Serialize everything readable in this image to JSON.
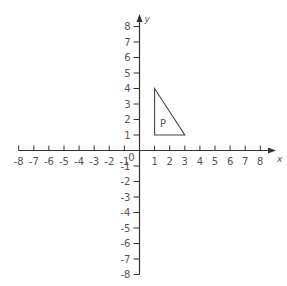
{
  "diagram": {
    "type": "coordinate-grid",
    "x_axis": {
      "label": "x",
      "min": -8,
      "max": 8,
      "ticks": [
        -8,
        -7,
        -6,
        -5,
        -4,
        -3,
        -2,
        -1,
        1,
        2,
        3,
        4,
        5,
        6,
        7,
        8
      ]
    },
    "y_axis": {
      "label": "y",
      "min": -8,
      "max": 8,
      "ticks": [
        -8,
        -7,
        -6,
        -5,
        -4,
        -3,
        -2,
        -1,
        1,
        2,
        3,
        4,
        5,
        6,
        7,
        8
      ]
    },
    "origin_label": "0",
    "shapes": [
      {
        "name": "P",
        "type": "triangle",
        "vertices": [
          [
            1,
            4
          ],
          [
            1,
            1
          ],
          [
            3,
            1
          ]
        ],
        "label_pos": [
          1.55,
          1.75
        ]
      }
    ],
    "colors": {
      "axis": "#333333",
      "text": "#555555",
      "shape": "#444444"
    }
  }
}
